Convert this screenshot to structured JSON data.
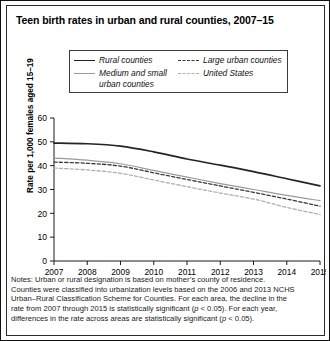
{
  "figure": {
    "title": "Teen birth rates in urban and rural counties, 2007–15",
    "notes_line1": "Notes: Urban or rural designation is based on mother’s county of residence.",
    "notes_line2": "Counties were classified into urbanization levels based on the 2006 and 2013 NCHS",
    "notes_line3": "Urban–Rural Classification Scheme for Counties. For each area, the decline in the",
    "notes_line4_a": "rate from 2007 through 2015 is statistically significant (",
    "notes_line4_p": "p",
    "notes_line4_b": " < 0.05). For each year,",
    "notes_line5_a": "differences in the rate across areas are statistically significant (",
    "notes_line5_p": "p",
    "notes_line5_b": " < 0.05)."
  },
  "legend": {
    "items": [
      {
        "label": "Rural counties",
        "style": "solid-dark",
        "color": "#242424"
      },
      {
        "label": "Large urban counties",
        "style": "dash-dark",
        "color": "#3a3a3a"
      },
      {
        "label": "Medium and small urban counties",
        "style": "solid-gray",
        "color": "#9a9a9a"
      },
      {
        "label": "United States",
        "style": "dash-gray",
        "color": "#b0b0b0"
      }
    ]
  },
  "chart_data": {
    "type": "line",
    "title": "Teen birth rates in urban and rural counties, 2007–15",
    "xlabel": "",
    "ylabel": "Rate per 1,000 females aged 15–19",
    "categories": [
      "2007",
      "2008",
      "2009",
      "2010",
      "2011",
      "2012",
      "2013",
      "2014",
      "2015"
    ],
    "x": [
      2007,
      2008,
      2009,
      2010,
      2011,
      2012,
      2013,
      2014,
      2015
    ],
    "xlim": [
      2007,
      2015
    ],
    "ylim": [
      0,
      60
    ],
    "yticks": [
      0,
      10,
      20,
      30,
      40,
      50,
      60
    ],
    "xticks": [
      "2007",
      "2008",
      "2009",
      "2010",
      "2011",
      "2012",
      "2013",
      "2014",
      "2015"
    ],
    "grid": false,
    "legend_position": "top-inside",
    "series": [
      {
        "name": "Rural counties",
        "style": "solid",
        "color": "#242424",
        "width": 1.7,
        "values": [
          49.5,
          49.2,
          48.2,
          45.8,
          42.8,
          40.2,
          37.5,
          34.5,
          31.5
        ]
      },
      {
        "name": "Medium and small urban counties",
        "style": "solid",
        "color": "#9a9a9a",
        "width": 1.2,
        "values": [
          43.2,
          42.3,
          40.8,
          38.0,
          35.2,
          32.5,
          30.0,
          27.5,
          25.3
        ]
      },
      {
        "name": "Large urban counties",
        "style": "dashed",
        "color": "#3a3a3a",
        "width": 1.3,
        "values": [
          41.5,
          41.0,
          39.8,
          37.0,
          34.2,
          31.5,
          28.8,
          26.0,
          23.0
        ]
      },
      {
        "name": "United States",
        "style": "dashed",
        "color": "#b0b0b0",
        "width": 1.3,
        "values": [
          39.0,
          38.2,
          36.8,
          34.0,
          31.2,
          28.5,
          26.0,
          22.5,
          19.5
        ]
      }
    ]
  }
}
